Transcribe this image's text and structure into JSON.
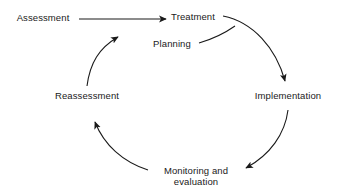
{
  "diagram": {
    "type": "cycle-flow-diagram",
    "orientation": "clockwise",
    "stroke_color": "#1a1a1a",
    "background_color": "#ffffff",
    "entry": {
      "label": "Assessment",
      "arrow_to": "Treatment",
      "arrow_kind": "straight-arrow"
    },
    "nodes": [
      {
        "id": "treatment",
        "label": "Treatment",
        "x": 193,
        "y": 16,
        "lines": [
          "Treatment"
        ]
      },
      {
        "id": "implementation",
        "label": "Implementation",
        "x": 288,
        "y": 96,
        "lines": [
          "Implementation"
        ]
      },
      {
        "id": "monitoring",
        "label": "Monitoring and evaluation",
        "x": 194,
        "y": 175,
        "lines": [
          "Monitoring and",
          "evaluation"
        ]
      },
      {
        "id": "reassessment",
        "label": "Reassessment",
        "x": 87,
        "y": 96,
        "lines": [
          "Reassessment"
        ]
      },
      {
        "id": "planning",
        "label": "Planning",
        "x": 172,
        "y": 44,
        "lines": [
          "Planning"
        ]
      }
    ],
    "entry_node": {
      "id": "assessment",
      "label": "Assessment",
      "x": 43,
      "y": 17
    },
    "arcs": [
      {
        "from": "treatment",
        "to": "implementation",
        "arrowhead_at": "upper-right"
      },
      {
        "from": "implementation",
        "to": "monitoring",
        "arrowhead_at": "lower-right"
      },
      {
        "from": "monitoring",
        "to": "reassessment",
        "arrowhead_at": "lower-left"
      },
      {
        "from": "reassessment",
        "to": "planning",
        "arrowhead_at": "upper-left"
      },
      {
        "from": "planning",
        "to": "treatment",
        "arrowhead_at": "none"
      }
    ]
  }
}
